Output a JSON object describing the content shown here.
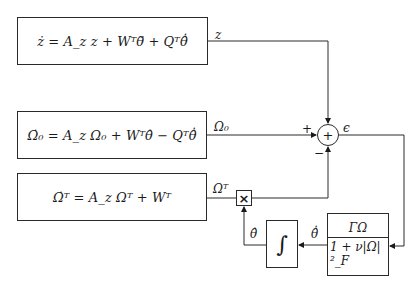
{
  "diagram": {
    "type": "block-diagram",
    "blocks": {
      "z_dynamics": {
        "equation": "ż = A_z z + Wᵀθ̃ + Qᵀθ̂̇"
      },
      "omega0_dynamics": {
        "equation": "Ω̇₀ = A_z Ω₀ + Wᵀθ̂ − Qᵀθ̂̇"
      },
      "omegaT_dynamics": {
        "equation": "Ω̇ᵀ = A_z Ωᵀ + Wᵀ"
      },
      "integrator": {
        "symbol": "∫"
      },
      "gain": {
        "numerator": "ΓΩ",
        "denominator": "1 + ν|Ω|²_F"
      },
      "multiplier": {
        "symbol": "×"
      },
      "summing_junction": {
        "symbol": "+"
      }
    },
    "signals": {
      "z": "z",
      "omega0": "Ω₀",
      "omegaT": "Ωᵀ",
      "epsilon": "ϵ",
      "theta_hat": "θ̂",
      "theta_hat_dot": "θ̂̇"
    },
    "signs": {
      "plus": "+",
      "minus": "−"
    }
  }
}
